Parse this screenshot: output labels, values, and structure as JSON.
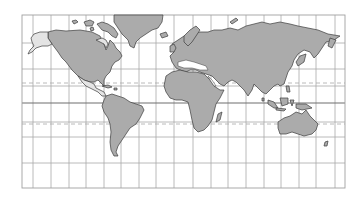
{
  "map": {
    "projection": "Mercator world map",
    "colors": {
      "land": "#ababab",
      "land_highlight": "#e4e4e4",
      "coastline": "#3c3c3c",
      "grid": "#a8a8a8",
      "equator": "#6e6e6e",
      "background": "#ffffff"
    },
    "frame": {
      "left": 22,
      "top": 15,
      "right": 345,
      "bottom": 188
    },
    "meridians_x": [
      33,
      51,
      69,
      86,
      104,
      121,
      139,
      156,
      174,
      193,
      211,
      228,
      246,
      264,
      281,
      299,
      316,
      335
    ],
    "parallels_y": [
      43,
      69,
      86,
      122,
      137,
      163
    ],
    "equator_y": 103,
    "tropic_of_cancer_y": 83,
    "tropic_of_capricorn_y": 124,
    "regions": [
      "North America",
      "Alaska (highlighted)",
      "Arctic Canada islands (highlighted)",
      "Central America (highlighted)",
      "Greenland",
      "South America",
      "Europe",
      "Africa",
      "Madagascar",
      "Asia",
      "Japan",
      "Indonesia / Maritime Southeast Asia",
      "Australia",
      "New Zealand"
    ]
  }
}
